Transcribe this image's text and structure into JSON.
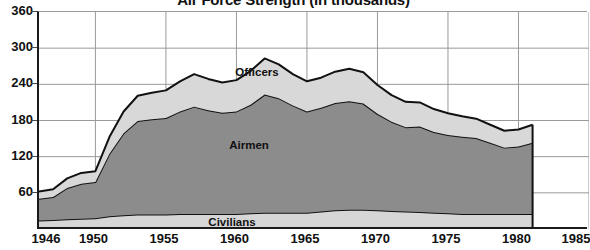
{
  "chart_data": {
    "type": "area",
    "stacked": true,
    "title": "Air Force Strength (in thousands)",
    "title_units": "(in thousands)",
    "title_clipped": true,
    "xlabel": "",
    "ylabel": "",
    "xlim": [
      1946,
      1985
    ],
    "ylim": [
      0,
      360
    ],
    "grid": true,
    "legend_position": "inline-labels",
    "y_ticks": [
      60,
      120,
      180,
      240,
      300,
      360
    ],
    "x_ticks": [
      1946,
      1950,
      1955,
      1960,
      1965,
      1970,
      1975,
      1980,
      1985
    ],
    "x": [
      1946,
      1947,
      1948,
      1949,
      1950,
      1951,
      1952,
      1953,
      1954,
      1955,
      1956,
      1957,
      1958,
      1959,
      1960,
      1961,
      1962,
      1963,
      1964,
      1965,
      1966,
      1967,
      1968,
      1969,
      1970,
      1971,
      1972,
      1973,
      1974,
      1975,
      1976,
      1977,
      1978,
      1979,
      1980,
      1981
    ],
    "series": [
      {
        "name": "Civilians",
        "color": "#d6d6d6",
        "values": [
          14,
          15,
          16,
          17,
          18,
          21,
          23,
          24,
          24,
          24,
          25,
          25,
          25,
          25,
          25,
          26,
          27,
          27,
          27,
          27,
          29,
          31,
          32,
          32,
          31,
          30,
          29,
          28,
          27,
          26,
          25,
          25,
          25,
          25,
          25,
          25
        ]
      },
      {
        "name": "Airmen",
        "color": "#8c8c8c",
        "values": [
          36,
          38,
          52,
          58,
          60,
          104,
          136,
          155,
          158,
          160,
          170,
          178,
          172,
          168,
          170,
          180,
          196,
          190,
          178,
          168,
          172,
          178,
          180,
          176,
          160,
          148,
          140,
          142,
          134,
          130,
          128,
          126,
          118,
          110,
          112,
          118
        ]
      },
      {
        "name": "Officers",
        "color": "#d8d8d8",
        "values": [
          12,
          13,
          16,
          18,
          18,
          28,
          36,
          42,
          44,
          46,
          50,
          54,
          52,
          50,
          52,
          56,
          60,
          56,
          52,
          50,
          50,
          52,
          54,
          52,
          48,
          44,
          42,
          40,
          38,
          36,
          34,
          32,
          30,
          28,
          28,
          30
        ]
      }
    ],
    "series_labels": [
      {
        "name": "Officers",
        "x_pos": 1960
      },
      {
        "name": "Airmen",
        "x_pos": 1959
      },
      {
        "name": "Civilians",
        "x_pos": 1958
      }
    ],
    "colors": {
      "civilians": "#d6d6d6",
      "airmen": "#8c8c8c",
      "officers": "#d8d8d8",
      "outline": "#111111",
      "grid": "#9a9a9a",
      "axis": "#1a1a1a",
      "background": "#ffffff",
      "text": "#111111"
    }
  }
}
